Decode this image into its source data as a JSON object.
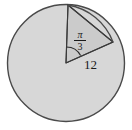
{
  "figure": {
    "kind": "circle-with-inscribed-triangle-and-central-angle",
    "background_color": "#ffffff",
    "circle": {
      "fill_color": "#d6d6d6",
      "stroke_color": "#4a4a4a",
      "center_x": 66,
      "center_y": 63,
      "radius": 59
    },
    "triangle": {
      "fill_color": "#cccccc",
      "stroke_color": "#3a3a3a",
      "vertices": [
        {
          "name": "center",
          "x": 66,
          "y": 63
        },
        {
          "name": "top-of-circle",
          "x": 68,
          "y": 5
        },
        {
          "name": "point-on-circle-right",
          "x": 113,
          "y": 42
        }
      ]
    },
    "chord": {
      "from": "top-of-circle",
      "to": "point-on-circle-right",
      "stroke_color": "#3a3a3a"
    },
    "angle_arc": {
      "stroke_color": "#2a2a2a",
      "radius": 16,
      "at_vertex": "center"
    },
    "labels": {
      "angle": {
        "text": "pi/3",
        "numerator": "π",
        "denominator": "3",
        "describes": "central angle measure in radians"
      },
      "side": {
        "text": "12",
        "describes": "length of the horizontal radius from center to point on circle"
      }
    }
  }
}
